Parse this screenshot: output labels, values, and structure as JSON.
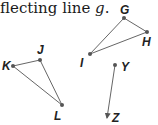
{
  "caption": {
    "prefix": "flecting line ",
    "variable": "g",
    "suffix": "."
  },
  "figures": {
    "triangle_GHI": {
      "vertices": [
        "G",
        "H",
        "I"
      ]
    },
    "triangle_JKL": {
      "vertices": [
        "J",
        "K",
        "L"
      ]
    },
    "segment_YZ": {
      "from": "Y",
      "to": "Z",
      "arrow_at": "Z"
    }
  },
  "labels": {
    "G": "G",
    "H": "H",
    "I": "I",
    "J": "J",
    "K": "K",
    "L": "L",
    "Y": "Y",
    "Z": "Z"
  },
  "colors": {
    "line": "#555555",
    "point": "#555555",
    "text": "#222222"
  }
}
